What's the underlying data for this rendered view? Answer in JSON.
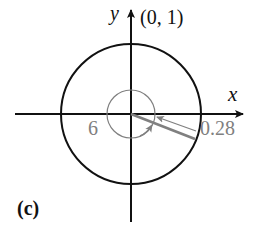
{
  "figure": {
    "panel_label": "(c)",
    "axes": {
      "x_label": "x",
      "y_label": "y"
    },
    "point_label": "(0, 1)",
    "angle_label": "6",
    "value_label": "0.28",
    "colors": {
      "axis": "#111111",
      "circle": "#111111",
      "highlight": "#808080"
    }
  }
}
